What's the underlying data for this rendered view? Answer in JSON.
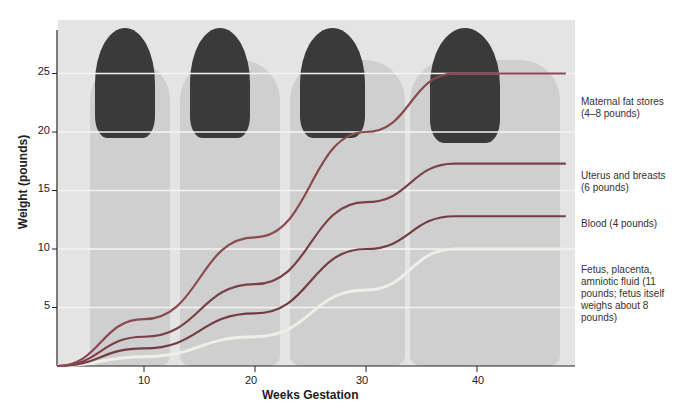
{
  "chart_data": {
    "type": "area",
    "title": "",
    "xlabel": "Weeks Gestation",
    "ylabel": "Weight (pounds)",
    "x_ticks": [
      10,
      20,
      30,
      40
    ],
    "y_ticks": [
      5,
      10,
      15,
      20,
      25
    ],
    "xlim": [
      2,
      48
    ],
    "ylim": [
      0,
      28
    ],
    "stacked": true,
    "grid": true,
    "x": [
      2,
      10,
      20,
      30,
      38,
      48
    ],
    "series": [
      {
        "name": "Fetus, placenta, amniotic fluid (11 pounds; fetus itself weighs about 8 pounds)",
        "values": [
          0,
          0.8,
          2.5,
          6.5,
          10,
          10
        ]
      },
      {
        "name": "Blood (4 pounds)",
        "values": [
          0,
          1.5,
          4.5,
          10,
          12.8,
          12.8
        ]
      },
      {
        "name": "Uterus and breasts (6 pounds)",
        "values": [
          0,
          2.5,
          7,
          14,
          17.3,
          17.3
        ]
      },
      {
        "name": "Maternal fat stores (4–8 pounds)",
        "values": [
          0,
          4,
          11,
          20,
          25,
          25
        ]
      }
    ],
    "legend_position": "right",
    "background": "Illustration of a woman at four stages of pregnancy"
  },
  "axis": {
    "ylabel": "Weight (pounds)",
    "xlabel": "Weeks Gestation",
    "y_ticks": [
      "25",
      "20",
      "15",
      "10",
      "5"
    ],
    "x_ticks": [
      "10",
      "20",
      "30",
      "40"
    ]
  },
  "legend": {
    "fat": "Maternal fat stores (4–8 pounds)",
    "uterus": "Uterus and breasts (6 pounds)",
    "blood": "Blood (4 pounds)",
    "fetus": "Fetus, placenta, amniotic fluid (11 pounds; fetus itself weighs about 8 pounds)"
  },
  "colors": {
    "fat": "#8a4a4e",
    "uterus": "#7a4247",
    "blood": "#733c42",
    "fetus": "#f0eee8"
  }
}
